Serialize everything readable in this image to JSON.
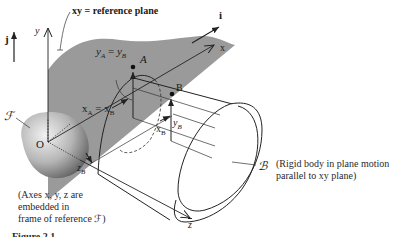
{
  "figure": {
    "labels": {
      "reference_plane": "xy = reference plane",
      "unit_j": "j",
      "unit_i": "i",
      "axis_y": "y",
      "axis_x": "x",
      "axis_z": "z",
      "origin": "O",
      "frame": "ℱ",
      "body": "ℬ",
      "point_A": "A",
      "point_B": "B",
      "yA_eq_yB": "yₐ = yʙ",
      "xA_eq_xB": "xₐ = xʙ",
      "yB": "yʙ",
      "xB": "xʙ",
      "zB": "zʙ"
    },
    "subscripts": {
      "yA_main": "y",
      "yA_sub": "A",
      "yB_main": "y",
      "yB_sub": "B",
      "xA_main": "x",
      "xA_sub": "A",
      "xB_main": "x",
      "xB_sub": "B",
      "zB_main": "z",
      "zB_sub": "B",
      "eq": "="
    },
    "notes": {
      "axes_note_line1": "(Axes x, y, z are",
      "axes_note_line2": "embedded in",
      "axes_note_line3": "frame of reference ℱ)",
      "body_note_line1": "(Rigid body in plane motion",
      "body_note_line2": "parallel to xy plane)"
    },
    "caption_partial": "Figure 2.1"
  },
  "colors": {
    "plane_fill": "#9a9a9a",
    "line": "#2a2a2a",
    "frame_body_light": "#e6e6e6",
    "frame_body_dark": "#6e6e6e"
  }
}
